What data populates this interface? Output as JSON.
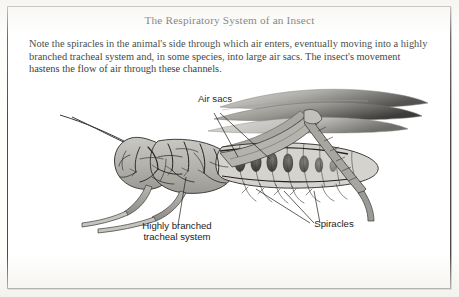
{
  "figure": {
    "title": "The Respiratory System of an Insect",
    "caption": "Note the spiracles in the animal's side through which air enters, eventually moving into a highly branched tracheal system and, in some species, into large air sacs. The insect's movement hastens the flow of air through these channels.",
    "frame_border_color": "#4a4a4a",
    "page_background": "#fdfdfb",
    "text_color": "#201f1c",
    "body_fill_color": "#b9b7b2",
    "trachea_line_color": "#2b2a28",
    "wing_color": "#8e8d89"
  },
  "labels": [
    {
      "id": "air-sacs",
      "text": "Air sacs",
      "leader_count": 2
    },
    {
      "id": "tracheal-system",
      "text": "Highly branched\ntracheal system",
      "leader_count": 1
    },
    {
      "id": "spiracles",
      "text": "Spiracles",
      "leader_count": 3
    }
  ]
}
